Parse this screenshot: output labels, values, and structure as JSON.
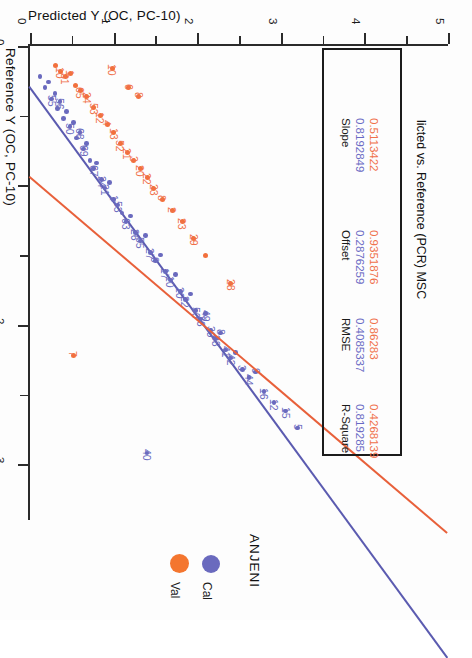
{
  "chart_title": "licted vs. Reference (PCR) MSC",
  "legend": {
    "title": "ANJENI",
    "entries": [
      {
        "label": "Val",
        "color": "#f4762f"
      },
      {
        "label": "Cal",
        "color": "#6a6abe"
      }
    ]
  },
  "stats_table": {
    "columns": [
      "Slope",
      "Offset",
      "RMSE",
      "R-Square"
    ],
    "rows": [
      {
        "series": "Cal",
        "color": "#6a6ac4",
        "values": [
          "0.8192849",
          "0.2876259",
          "0.4085337",
          "0.819285"
        ]
      },
      {
        "series": "Val",
        "color": "#f0704a",
        "values": [
          "0.5113422",
          "0.9351876",
          "0.86283",
          "0.4268139"
        ]
      }
    ]
  },
  "chart_data": {
    "type": "scatter",
    "title": "licted vs. Reference (PCR) MSC",
    "xlabel": "Predicted Y (OC, PC-10)",
    "ylabel": "Reference Y (OC, PC-10)",
    "xlim": [
      0,
      5
    ],
    "ylim": [
      0,
      3.4
    ],
    "xticks": [
      0,
      1,
      2,
      3,
      4,
      5
    ],
    "yticks": [
      0,
      1,
      2,
      3
    ],
    "xtick_labels": [
      "0",
      "1",
      "2",
      "3",
      "4",
      "5"
    ],
    "ytick_labels": [
      "0",
      "1",
      "2",
      "3"
    ],
    "grid": false,
    "legend_position": "bottom",
    "series": [
      {
        "name": "Cal",
        "color": "#6a6abe",
        "fit": {
          "slope": 0.8192849,
          "offset": 0.2876259,
          "rmse": 0.4085337,
          "r_square": 0.819285
        },
        "points": [
          {
            "x": 0.12,
            "y": 0.22,
            "label": ""
          },
          {
            "x": 0.18,
            "y": 0.3,
            "label": ""
          },
          {
            "x": 0.22,
            "y": 0.26,
            "label": ""
          },
          {
            "x": 0.26,
            "y": 0.38,
            "label": "55"
          },
          {
            "x": 0.3,
            "y": 0.34,
            "label": ""
          },
          {
            "x": 0.33,
            "y": 0.45,
            "label": ""
          },
          {
            "x": 0.36,
            "y": 0.4,
            "label": "56"
          },
          {
            "x": 0.4,
            "y": 0.52,
            "label": ""
          },
          {
            "x": 0.44,
            "y": 0.47,
            "label": ""
          },
          {
            "x": 0.48,
            "y": 0.58,
            "label": "50"
          },
          {
            "x": 0.52,
            "y": 0.55,
            "label": ""
          },
          {
            "x": 0.56,
            "y": 0.66,
            "label": ""
          },
          {
            "x": 0.6,
            "y": 0.62,
            "label": "68"
          },
          {
            "x": 0.64,
            "y": 0.74,
            "label": "69"
          },
          {
            "x": 0.68,
            "y": 0.7,
            "label": ""
          },
          {
            "x": 0.72,
            "y": 0.82,
            "label": ""
          },
          {
            "x": 0.76,
            "y": 0.88,
            "label": "67"
          },
          {
            "x": 0.8,
            "y": 0.84,
            "label": ""
          },
          {
            "x": 0.86,
            "y": 0.96,
            "label": "24"
          },
          {
            "x": 0.9,
            "y": 1.02,
            "label": "21"
          },
          {
            "x": 0.95,
            "y": 0.98,
            "label": ""
          },
          {
            "x": 1.0,
            "y": 1.1,
            "label": "1"
          },
          {
            "x": 1.05,
            "y": 1.14,
            "label": "53"
          },
          {
            "x": 1.1,
            "y": 1.2,
            "label": ""
          },
          {
            "x": 1.15,
            "y": 1.26,
            "label": "63"
          },
          {
            "x": 1.2,
            "y": 1.22,
            "label": ""
          },
          {
            "x": 1.26,
            "y": 1.34,
            "label": "26"
          },
          {
            "x": 1.32,
            "y": 1.4,
            "label": "55"
          },
          {
            "x": 1.38,
            "y": 1.36,
            "label": ""
          },
          {
            "x": 1.44,
            "y": 1.48,
            "label": "27"
          },
          {
            "x": 1.5,
            "y": 1.54,
            "label": "9"
          },
          {
            "x": 1.56,
            "y": 1.5,
            "label": ""
          },
          {
            "x": 1.62,
            "y": 1.62,
            "label": "17"
          },
          {
            "x": 1.68,
            "y": 1.68,
            "label": "10"
          },
          {
            "x": 1.74,
            "y": 1.64,
            "label": ""
          },
          {
            "x": 1.8,
            "y": 1.76,
            "label": "20"
          },
          {
            "x": 1.86,
            "y": 1.82,
            "label": "22"
          },
          {
            "x": 1.92,
            "y": 1.78,
            "label": ""
          },
          {
            "x": 1.98,
            "y": 1.9,
            "label": "50"
          },
          {
            "x": 2.04,
            "y": 1.96,
            "label": "36"
          },
          {
            "x": 2.1,
            "y": 1.92,
            "label": "49"
          },
          {
            "x": 2.16,
            "y": 2.04,
            "label": "39"
          },
          {
            "x": 2.22,
            "y": 2.1,
            "label": "38"
          },
          {
            "x": 2.28,
            "y": 2.06,
            "label": "8"
          },
          {
            "x": 2.34,
            "y": 2.18,
            "label": "41"
          },
          {
            "x": 2.4,
            "y": 2.24,
            "label": "42"
          },
          {
            "x": 2.46,
            "y": 2.2,
            "label": ""
          },
          {
            "x": 2.54,
            "y": 2.32,
            "label": "3"
          },
          {
            "x": 2.62,
            "y": 2.38,
            "label": "44"
          },
          {
            "x": 2.7,
            "y": 2.34,
            "label": "9"
          },
          {
            "x": 2.8,
            "y": 2.48,
            "label": "16"
          },
          {
            "x": 2.92,
            "y": 2.56,
            "label": "12"
          },
          {
            "x": 3.06,
            "y": 2.62,
            "label": "15"
          },
          {
            "x": 3.2,
            "y": 2.74,
            "label": "5"
          },
          {
            "x": 1.4,
            "y": 2.92,
            "label": "40"
          }
        ]
      },
      {
        "name": "Val",
        "color": "#f2703c",
        "fit": {
          "slope": 0.5113422,
          "offset": 0.9351876,
          "rmse": 0.86283,
          "r_square": 0.4268139
        },
        "points": [
          {
            "x": 0.3,
            "y": 0.14,
            "label": ""
          },
          {
            "x": 0.36,
            "y": 0.18,
            "label": "10"
          },
          {
            "x": 0.42,
            "y": 0.22,
            "label": "31"
          },
          {
            "x": 0.48,
            "y": 0.2,
            "label": "1"
          },
          {
            "x": 0.54,
            "y": 0.28,
            "label": ""
          },
          {
            "x": 0.6,
            "y": 0.32,
            "label": "65"
          },
          {
            "x": 0.68,
            "y": 0.36,
            "label": "24"
          },
          {
            "x": 0.76,
            "y": 0.44,
            "label": "53"
          },
          {
            "x": 0.84,
            "y": 0.5,
            "label": "12"
          },
          {
            "x": 0.92,
            "y": 0.56,
            "label": "4"
          },
          {
            "x": 1.0,
            "y": 0.62,
            "label": "13"
          },
          {
            "x": 1.08,
            "y": 0.7,
            "label": "52"
          },
          {
            "x": 1.16,
            "y": 0.76,
            "label": "21"
          },
          {
            "x": 1.24,
            "y": 0.82,
            "label": "3"
          },
          {
            "x": 1.32,
            "y": 0.88,
            "label": "20"
          },
          {
            "x": 1.4,
            "y": 0.94,
            "label": "22"
          },
          {
            "x": 1.48,
            "y": 1.02,
            "label": "23"
          },
          {
            "x": 1.58,
            "y": 1.1,
            "label": "8"
          },
          {
            "x": 1.7,
            "y": 1.18,
            "label": "2"
          },
          {
            "x": 1.82,
            "y": 1.26,
            "label": "23"
          },
          {
            "x": 1.96,
            "y": 1.38,
            "label": "29"
          },
          {
            "x": 2.1,
            "y": 1.5,
            "label": ""
          },
          {
            "x": 2.4,
            "y": 1.7,
            "label": "28"
          },
          {
            "x": 1.18,
            "y": 0.3,
            "label": "6"
          },
          {
            "x": 1.3,
            "y": 0.36,
            "label": "8"
          },
          {
            "x": 0.98,
            "y": 0.16,
            "label": "10"
          },
          {
            "x": 0.52,
            "y": 2.22,
            "label": "7"
          }
        ]
      }
    ]
  }
}
